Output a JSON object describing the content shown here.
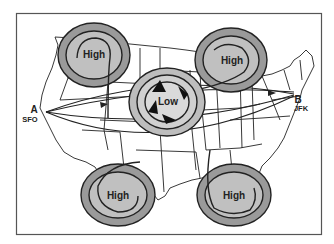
{
  "diagram": {
    "type": "weather-map-flight-routes",
    "colors": {
      "frame": "#555555",
      "map_lines": "#222222",
      "system_fill_outer": "#9a9a9a",
      "system_fill_inner": "#c8c8c8",
      "low_fill": "#d8d8d8",
      "background": "#ffffff"
    },
    "systems": [
      {
        "id": "high-nw",
        "label": "High",
        "kind": "high",
        "cx": 94,
        "cy": 55
      },
      {
        "id": "high-ne",
        "label": "High",
        "kind": "high",
        "cx": 230,
        "cy": 60
      },
      {
        "id": "low-center",
        "label": "Low",
        "kind": "low",
        "cx": 167,
        "cy": 102
      },
      {
        "id": "high-sw",
        "label": "High",
        "kind": "high",
        "cx": 118,
        "cy": 195
      },
      {
        "id": "high-se",
        "label": "High",
        "kind": "high",
        "cx": 234,
        "cy": 195
      }
    ],
    "points": {
      "a": {
        "letter": "A",
        "code": "SFO"
      },
      "b": {
        "letter": "B",
        "code": "JFK"
      }
    },
    "routes": [
      {
        "id": "route-direct",
        "description": "Great-circle route A to B"
      },
      {
        "id": "route-north",
        "description": "Route around north of Low"
      },
      {
        "id": "route-south",
        "description": "Route around south of Low"
      }
    ]
  }
}
